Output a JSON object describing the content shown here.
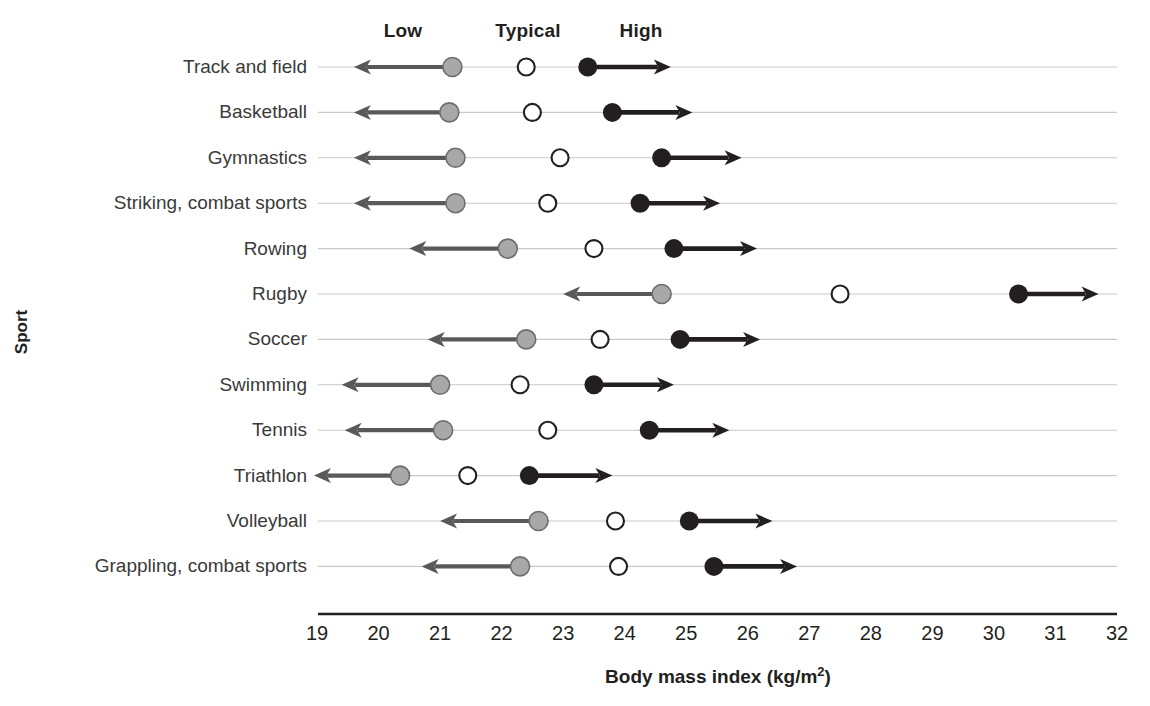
{
  "chart_data": {
    "type": "range-dot",
    "title": "",
    "xlabel": "Body mass index (kg/m2)",
    "xlabel_html": "Body mass index (kg/m²)",
    "ylabel": "Sport",
    "xlim": [
      19,
      32
    ],
    "xticks": [
      19,
      20,
      21,
      22,
      23,
      24,
      25,
      26,
      27,
      28,
      29,
      30,
      31,
      32
    ],
    "grid": true,
    "legend_position": "top",
    "column_headers": [
      {
        "label": "Low",
        "value": 20.4
      },
      {
        "label": "Typical",
        "value": 22.4
      },
      {
        "label": "High",
        "value": 24.25
      }
    ],
    "series": [
      {
        "name": "Low",
        "marker": "filled-circle-gray",
        "color": "#a8a8a8",
        "arrow": "left"
      },
      {
        "name": "Typical",
        "marker": "open-circle",
        "color": "#ffffff",
        "arrow": "none"
      },
      {
        "name": "High",
        "marker": "filled-circle-black",
        "color": "#231f20",
        "arrow": "right"
      }
    ],
    "categories": [
      "Track and field",
      "Basketball",
      "Gymnastics",
      "Striking, combat sports",
      "Rowing",
      "Rugby",
      "Soccer",
      "Swimming",
      "Tennis",
      "Triathlon",
      "Volleyball",
      "Grappling, combat sports"
    ],
    "rows": [
      {
        "category": "Track and field",
        "low": 21.2,
        "low_arrow_end": 19.6,
        "typical": 22.4,
        "high": 23.4,
        "high_arrow_end": 24.75
      },
      {
        "category": "Basketball",
        "low": 21.15,
        "low_arrow_end": 19.6,
        "typical": 22.5,
        "high": 23.8,
        "high_arrow_end": 25.1
      },
      {
        "category": "Gymnastics",
        "low": 21.25,
        "low_arrow_end": 19.6,
        "typical": 22.95,
        "high": 24.6,
        "high_arrow_end": 25.9
      },
      {
        "category": "Striking, combat sports",
        "low": 21.25,
        "low_arrow_end": 19.6,
        "typical": 22.75,
        "high": 24.25,
        "high_arrow_end": 25.55
      },
      {
        "category": "Rowing",
        "low": 22.1,
        "low_arrow_end": 20.5,
        "typical": 23.5,
        "high": 24.8,
        "high_arrow_end": 26.15
      },
      {
        "category": "Rugby",
        "low": 24.6,
        "low_arrow_end": 23.0,
        "typical": 27.5,
        "high": 30.4,
        "high_arrow_end": 31.7
      },
      {
        "category": "Soccer",
        "low": 22.4,
        "low_arrow_end": 20.8,
        "typical": 23.6,
        "high": 24.9,
        "high_arrow_end": 26.2
      },
      {
        "category": "Swimming",
        "low": 21.0,
        "low_arrow_end": 19.4,
        "typical": 22.3,
        "high": 23.5,
        "high_arrow_end": 24.8
      },
      {
        "category": "Tennis",
        "low": 21.05,
        "low_arrow_end": 19.45,
        "typical": 22.75,
        "high": 24.4,
        "high_arrow_end": 25.7
      },
      {
        "category": "Triathlon",
        "low": 20.35,
        "low_arrow_end": 18.95,
        "typical": 21.45,
        "high": 22.45,
        "high_arrow_end": 23.8
      },
      {
        "category": "Volleyball",
        "low": 22.6,
        "low_arrow_end": 21.0,
        "typical": 23.85,
        "high": 25.05,
        "high_arrow_end": 26.4
      },
      {
        "category": "Grappling, combat sports",
        "low": 22.3,
        "low_arrow_end": 20.7,
        "typical": 23.9,
        "high": 25.45,
        "high_arrow_end": 26.8
      }
    ]
  },
  "colors": {
    "low_marker": "#a8a8a8",
    "low_marker_edge": "#6d6d6d",
    "low_arrow": "#595959",
    "typical_marker_fill": "#ffffff",
    "typical_marker_edge": "#231f20",
    "high_marker": "#231f20",
    "high_arrow": "#231f20",
    "gridline": "#c9c9c9",
    "axis": "#231f20",
    "text": "#231f20"
  }
}
